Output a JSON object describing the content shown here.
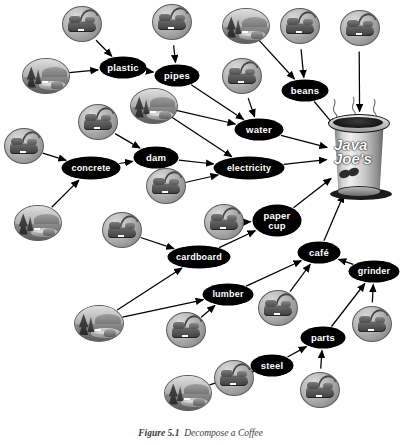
{
  "figure": {
    "caption_label": "Figure 5.1",
    "caption_text": "Decompose a Coffee",
    "title": "Decompose a Coffee",
    "diagram_type": "dependency-graph"
  },
  "colors": {
    "node_fill": "#000000",
    "node_text": "#ffffff",
    "icon_disc": "#b3b3b3",
    "label_box": "#0a0a0a",
    "page_background": "#ffffff",
    "arrow": "#000000"
  },
  "nodes": [
    {
      "id": "plastic",
      "label": "plastic",
      "x": 100,
      "y": 57,
      "w": 46,
      "h": 21,
      "fs": 9.5
    },
    {
      "id": "pipes",
      "label": "pipes",
      "x": 155,
      "y": 65,
      "w": 44,
      "h": 21,
      "fs": 9.5
    },
    {
      "id": "beans",
      "label": "beans",
      "x": 282,
      "y": 80,
      "w": 46,
      "h": 21,
      "fs": 9.5
    },
    {
      "id": "water",
      "label": "water",
      "x": 235,
      "y": 119,
      "w": 48,
      "h": 21,
      "fs": 9.5
    },
    {
      "id": "dam",
      "label": "dam",
      "x": 134,
      "y": 147,
      "w": 44,
      "h": 21,
      "fs": 9.5
    },
    {
      "id": "concrete",
      "label": "concrete",
      "x": 62,
      "y": 157,
      "w": 58,
      "h": 22,
      "fs": 9
    },
    {
      "id": "electricity",
      "label": "electricity",
      "x": 214,
      "y": 157,
      "w": 70,
      "h": 22,
      "fs": 9
    },
    {
      "id": "paper-cup",
      "label": "paper\ncup",
      "x": 253,
      "y": 205,
      "w": 48,
      "h": 31,
      "fs": 9.5
    },
    {
      "id": "cardboard",
      "label": "cardboard",
      "x": 168,
      "y": 246,
      "w": 62,
      "h": 22,
      "fs": 9
    },
    {
      "id": "cafe",
      "label": "café",
      "x": 298,
      "y": 242,
      "w": 42,
      "h": 21,
      "fs": 9.5
    },
    {
      "id": "grinder",
      "label": "grinder",
      "x": 349,
      "y": 261,
      "w": 50,
      "h": 21,
      "fs": 9
    },
    {
      "id": "lumber",
      "label": "lumber",
      "x": 203,
      "y": 284,
      "w": 50,
      "h": 21,
      "fs": 9
    },
    {
      "id": "parts",
      "label": "parts",
      "x": 301,
      "y": 327,
      "w": 44,
      "h": 21,
      "fs": 9.5
    },
    {
      "id": "steel",
      "label": "steel",
      "x": 251,
      "y": 355,
      "w": 42,
      "h": 21,
      "fs": 9.5
    }
  ],
  "resource_icons": [
    {
      "id": "oil",
      "label": "OIL",
      "x": 22,
      "y": 58,
      "w": 46,
      "h": 34
    },
    {
      "id": "land",
      "label": "LAND",
      "x": 222,
      "y": 8,
      "w": 46,
      "h": 34
    },
    {
      "id": "river",
      "label": "RIVER",
      "x": 130,
      "y": 88,
      "w": 46,
      "h": 34
    },
    {
      "id": "gravel",
      "label": "GRAVEL",
      "x": 14,
      "y": 205,
      "w": 46,
      "h": 34
    },
    {
      "id": "trees",
      "label": "TREES",
      "x": 74,
      "y": 305,
      "w": 48,
      "h": 35
    },
    {
      "id": "ore",
      "label": "ORE",
      "x": 164,
      "y": 375,
      "w": 46,
      "h": 34
    }
  ],
  "work_icons": [
    {
      "id": "work-plastic",
      "label": "WORK",
      "x": 62,
      "y": 6,
      "w": 38,
      "h": 34
    },
    {
      "id": "work-pipes",
      "label": "WORK",
      "x": 152,
      "y": 4,
      "w": 38,
      "h": 34
    },
    {
      "id": "work-beans-left",
      "label": "WORK",
      "x": 280,
      "y": 8,
      "w": 38,
      "h": 34
    },
    {
      "id": "work-beans-right",
      "label": "WORK",
      "x": 340,
      "y": 10,
      "w": 38,
      "h": 34
    },
    {
      "id": "work-water",
      "label": "WORK",
      "x": 222,
      "y": 58,
      "w": 38,
      "h": 34
    },
    {
      "id": "work-dam",
      "label": "WORK",
      "x": 78,
      "y": 104,
      "w": 38,
      "h": 34
    },
    {
      "id": "work-concrete",
      "label": "WORK",
      "x": 4,
      "y": 128,
      "w": 38,
      "h": 34
    },
    {
      "id": "work-electricity",
      "label": "WORK",
      "x": 146,
      "y": 168,
      "w": 38,
      "h": 34
    },
    {
      "id": "work-papercup",
      "label": "WORK",
      "x": 204,
      "y": 204,
      "w": 38,
      "h": 34
    },
    {
      "id": "work-cardboard",
      "label": "WORK",
      "x": 102,
      "y": 212,
      "w": 38,
      "h": 34
    },
    {
      "id": "work-lumber",
      "label": "WORK",
      "x": 166,
      "y": 312,
      "w": 38,
      "h": 34
    },
    {
      "id": "work-cafe",
      "label": "WORK",
      "x": 258,
      "y": 290,
      "w": 38,
      "h": 34
    },
    {
      "id": "work-grinder",
      "label": "WORK",
      "x": 352,
      "y": 306,
      "w": 38,
      "h": 34
    },
    {
      "id": "work-parts",
      "label": "WORK",
      "x": 300,
      "y": 372,
      "w": 38,
      "h": 34
    },
    {
      "id": "work-steel",
      "label": "WORK",
      "x": 214,
      "y": 360,
      "w": 38,
      "h": 34
    }
  ],
  "coffee_cup": {
    "id": "coffee-cup",
    "brand_line1": "Java",
    "brand_line2": "Joe's",
    "x": 326,
    "y": 110,
    "w": 68,
    "h": 92,
    "steam": true
  },
  "edges": [
    {
      "from": "work-plastic",
      "to": "plastic"
    },
    {
      "from": "oil",
      "to": "plastic"
    },
    {
      "from": "plastic",
      "to": "pipes"
    },
    {
      "from": "work-pipes",
      "to": "pipes"
    },
    {
      "from": "land",
      "to": "beans"
    },
    {
      "from": "work-beans-left",
      "to": "beans"
    },
    {
      "from": "work-beans-right",
      "to": "coffee-cup"
    },
    {
      "from": "beans",
      "to": "coffee-cup"
    },
    {
      "from": "pipes",
      "to": "water"
    },
    {
      "from": "work-water",
      "to": "water"
    },
    {
      "from": "river",
      "to": "water"
    },
    {
      "from": "river",
      "to": "electricity"
    },
    {
      "from": "water",
      "to": "coffee-cup"
    },
    {
      "from": "work-dam",
      "to": "dam"
    },
    {
      "from": "work-concrete",
      "to": "concrete"
    },
    {
      "from": "gravel",
      "to": "concrete"
    },
    {
      "from": "concrete",
      "to": "dam"
    },
    {
      "from": "dam",
      "to": "electricity"
    },
    {
      "from": "work-electricity",
      "to": "electricity"
    },
    {
      "from": "electricity",
      "to": "coffee-cup"
    },
    {
      "from": "work-cardboard",
      "to": "cardboard"
    },
    {
      "from": "trees",
      "to": "cardboard"
    },
    {
      "from": "trees",
      "to": "lumber"
    },
    {
      "from": "cardboard",
      "to": "paper-cup"
    },
    {
      "from": "work-papercup",
      "to": "paper-cup"
    },
    {
      "from": "paper-cup",
      "to": "coffee-cup"
    },
    {
      "from": "lumber",
      "to": "cafe"
    },
    {
      "from": "work-lumber",
      "to": "lumber"
    },
    {
      "from": "cafe",
      "to": "coffee-cup"
    },
    {
      "from": "work-cafe",
      "to": "cafe"
    },
    {
      "from": "grinder",
      "to": "cafe"
    },
    {
      "from": "work-grinder",
      "to": "grinder"
    },
    {
      "from": "parts",
      "to": "grinder"
    },
    {
      "from": "work-parts",
      "to": "parts"
    },
    {
      "from": "steel",
      "to": "parts"
    },
    {
      "from": "ore",
      "to": "steel"
    },
    {
      "from": "work-steel",
      "to": "steel"
    }
  ]
}
